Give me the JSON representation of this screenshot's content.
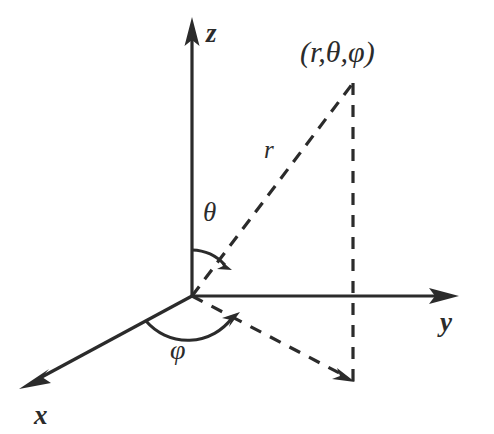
{
  "figure": {
    "background_color": "#ffffff",
    "stroke_color": "#2b2b2b",
    "labels": {
      "point": "(r,θ,φ)",
      "radius": "r",
      "polar_angle": "θ",
      "azimuthal_angle": "φ",
      "axis_x": "x",
      "axis_y": "y",
      "axis_z": "z"
    },
    "geometry": {
      "origin": [
        192,
        296
      ],
      "point_p": [
        353,
        83
      ],
      "projection_xy": [
        353,
        382
      ],
      "z_axis_tip": [
        192,
        18
      ],
      "y_axis_tip": [
        458,
        296
      ],
      "x_axis_tip": [
        20,
        388
      ]
    },
    "elements": {
      "solid_lines": [
        "z-axis",
        "y-axis",
        "x-axis",
        "theta-arc",
        "phi-arc"
      ],
      "dashed_lines": [
        "radius-line",
        "vertical-drop-line",
        "xy-projection-line"
      ]
    }
  }
}
